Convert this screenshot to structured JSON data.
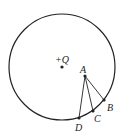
{
  "diagram": {
    "circle": {
      "cx": 62,
      "cy": 67,
      "r": 53
    },
    "charge": {
      "label": "+Q",
      "x": 62,
      "y": 67,
      "label_x": 55,
      "label_y": 63
    },
    "points": [
      {
        "name": "A",
        "x": 85,
        "y": 76,
        "label": "A",
        "lx": 80,
        "ly": 73
      },
      {
        "name": "B",
        "x": 104,
        "y": 100,
        "label": "B",
        "lx": 107,
        "ly": 111
      },
      {
        "name": "C",
        "x": 93,
        "y": 111,
        "label": "C",
        "lx": 94,
        "ly": 122
      },
      {
        "name": "D",
        "x": 79,
        "y": 118,
        "label": "D",
        "lx": 75,
        "ly": 131
      }
    ],
    "segments": [
      [
        "A",
        "B"
      ],
      [
        "A",
        "C"
      ],
      [
        "A",
        "D"
      ]
    ]
  }
}
